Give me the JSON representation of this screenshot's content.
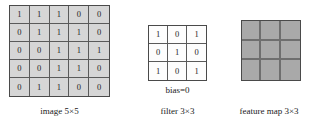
{
  "diagram": {
    "type": "convolution-illustration",
    "image_matrix": {
      "caption": "image 5×5",
      "rows": [
        [
          "1",
          "1",
          "1",
          "0",
          "0"
        ],
        [
          "0",
          "1",
          "1",
          "1",
          "0"
        ],
        [
          "0",
          "0",
          "1",
          "1",
          "1"
        ],
        [
          "0",
          "0",
          "1",
          "1",
          "0"
        ],
        [
          "0",
          "1",
          "1",
          "0",
          "0"
        ]
      ],
      "cell_color": "#d6d6d6",
      "border_color": "#5a5a5a"
    },
    "filter_matrix": {
      "caption": "filter 3×3",
      "bias_label": "bias=0",
      "rows": [
        [
          "1",
          "0",
          "1"
        ],
        [
          "0",
          "1",
          "0"
        ],
        [
          "1",
          "0",
          "1"
        ]
      ],
      "cell_color": "#fdfdfd",
      "border_color": "#5a5a5a"
    },
    "feature_map": {
      "caption": "feature map 3×3",
      "rows": [
        [
          "",
          "",
          ""
        ],
        [
          "",
          "",
          ""
        ],
        [
          "",
          "",
          ""
        ]
      ],
      "cell_color": "#a9a9a9",
      "border_color": "#6e6e6e"
    }
  }
}
